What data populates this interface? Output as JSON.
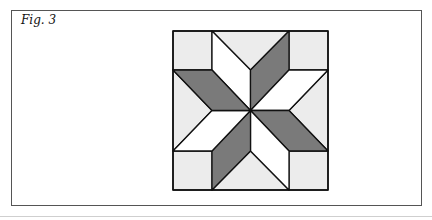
{
  "figure": {
    "label": "Fig. 3"
  },
  "colors": {
    "dark": "#7a7a7a",
    "light": "#ececec",
    "white": "#ffffff",
    "stroke": "#111111",
    "frame": "#555555"
  }
}
